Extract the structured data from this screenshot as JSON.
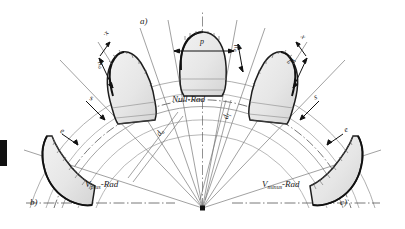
{
  "figure": {
    "background_color": "#ffffff",
    "line_color": "#2b2b2b",
    "tooth_fill_color": "#e8e8e8",
    "thin_line_color": "#9a9a9a"
  },
  "part_labels": {
    "a": "a)",
    "b": "b)",
    "c": "c)"
  },
  "wheel_labels": {
    "center": "Null-",
    "center_suffix": "Rad",
    "left": "V",
    "left_sub": "plus",
    "left_suffix": "-Rad",
    "right": "V",
    "right_sub": "minus",
    "right_suffix": "-Rad"
  },
  "dimensions": {
    "pitch": "p",
    "addendum": "h",
    "addendum_sub": "a",
    "profile_shift_left": "x",
    "profile_shift_left_mark": "·",
    "profile_shift_right": "x",
    "tooth_thickness_left": "s",
    "space_width_left": "e",
    "tooth_thickness_right": "s",
    "space_width_right": "e",
    "diameter_tip": "d",
    "diameter_tip_sub": "a",
    "diameter_pitch": "d",
    "diameter_pitch_sub": "f"
  }
}
